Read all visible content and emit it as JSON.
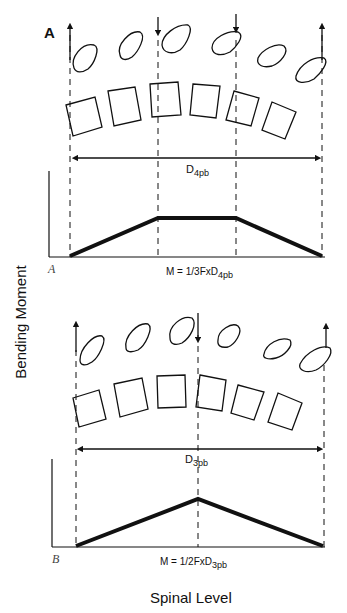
{
  "figure": {
    "y_axis_label": "Bending Moment",
    "x_axis_label": "Spinal Level",
    "panels": [
      {
        "id": "A",
        "panel_letter": "A",
        "panel_letter_small": "A",
        "loading": "four-point bending",
        "distance_label": "D",
        "distance_sub": "4pb",
        "formula_main": "M = 1/3FxD",
        "formula_sub": "4pb",
        "forces": [
          {
            "position": "left",
            "direction": "up"
          },
          {
            "position": "inner-left",
            "direction": "down"
          },
          {
            "position": "inner-right",
            "direction": "down"
          },
          {
            "position": "right",
            "direction": "up"
          }
        ],
        "moment_profile": "trapezoid"
      },
      {
        "id": "B",
        "panel_letter_small": "B",
        "loading": "three-point bending",
        "distance_label": "D",
        "distance_sub": "3pb",
        "formula_main": "M = 1/2FxD",
        "formula_sub": "3pb",
        "forces": [
          {
            "position": "left",
            "direction": "up"
          },
          {
            "position": "center",
            "direction": "down"
          },
          {
            "position": "right",
            "direction": "up"
          }
        ],
        "moment_profile": "triangle"
      }
    ]
  }
}
